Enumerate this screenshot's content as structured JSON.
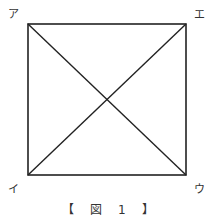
{
  "figure": {
    "caption": "【 図 1 】",
    "vertices": {
      "top_left": "ア",
      "bottom_left": "イ",
      "bottom_right": "ウ",
      "top_right": "エ"
    },
    "stroke_color": "#222222"
  }
}
